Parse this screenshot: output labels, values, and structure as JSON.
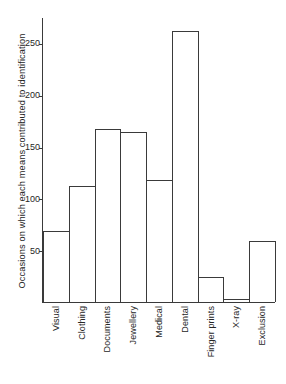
{
  "chart_data": {
    "type": "bar",
    "title": "",
    "xlabel": "",
    "ylabel": "Occasions on which each means contributed to identification",
    "categories": [
      "Visual",
      "Clothing",
      "Documents",
      "Jewellery",
      "Medical",
      "Dental",
      "Finger prints",
      "X-ray",
      "Exclusion"
    ],
    "values": [
      69,
      112,
      168,
      165,
      118,
      262,
      24,
      3,
      59
    ],
    "ylim": [
      0,
      275
    ],
    "yticks": [
      50,
      100,
      150,
      200,
      250
    ],
    "ytick_labels": [
      "50",
      "100",
      "150",
      "200",
      "250"
    ],
    "grid": false,
    "legend": null,
    "bar_facecolor": "#ffffff",
    "bar_edgecolor": "#3a3a3a",
    "axis_color": "#3a3a3a",
    "text_color": "#262626",
    "background": "#ffffff",
    "xtick_rotation": 90
  }
}
